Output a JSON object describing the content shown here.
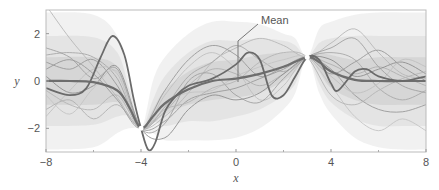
{
  "chart_data": {
    "type": "line",
    "title": "",
    "xlabel": "x",
    "ylabel": "y",
    "xlim": [
      -8,
      8
    ],
    "ylim": [
      -3,
      3
    ],
    "x_ticks": [
      -8,
      -4,
      0,
      4,
      8
    ],
    "x_tick_labels": [
      "−8",
      "−4",
      "0",
      "4",
      "8"
    ],
    "x_minor_ticks": [
      -6,
      -2,
      2,
      6
    ],
    "y_ticks": [
      2,
      0,
      -2
    ],
    "y_tick_labels": [
      "2",
      "0",
      "−2"
    ],
    "grid": false,
    "legend": null,
    "annotation": {
      "text": "Mean",
      "x": 0,
      "y": 0.1
    },
    "observations": {
      "x": [
        -4,
        3
      ],
      "y": [
        -2,
        1
      ]
    },
    "mean": {
      "name": "Mean",
      "x": [
        -8,
        -7,
        -6,
        -5,
        -4.5,
        -4,
        -3.5,
        -3,
        -2,
        -1,
        0,
        1,
        2,
        3,
        3.5,
        4,
        5,
        6,
        7,
        8
      ],
      "y": [
        0.0,
        0.0,
        -0.05,
        -0.4,
        -1.1,
        -2.0,
        -1.5,
        -0.95,
        -0.35,
        0.0,
        0.1,
        0.3,
        0.6,
        1.0,
        0.8,
        0.4,
        0.05,
        0.0,
        0.0,
        0.0
      ]
    },
    "bands": [
      {
        "name": "±3σ",
        "x": [
          -8,
          -6,
          -5,
          -4.5,
          -4,
          -3.5,
          -3,
          -2,
          -1,
          0,
          1,
          2,
          2.5,
          3,
          3.5,
          4,
          5,
          6,
          7,
          8
        ],
        "lower": [
          -2.9,
          -2.8,
          -2.2,
          -2.0,
          -2.0,
          -2.2,
          -2.5,
          -2.5,
          -2.5,
          -2.4,
          -2.0,
          -1.2,
          -0.5,
          1.0,
          -0.5,
          -1.4,
          -2.4,
          -2.8,
          -2.9,
          -2.9
        ],
        "upper": [
          2.9,
          2.8,
          1.9,
          0.0,
          -2.0,
          0.0,
          1.0,
          2.0,
          2.5,
          2.5,
          2.4,
          2.0,
          1.8,
          1.0,
          2.2,
          2.5,
          2.8,
          2.9,
          2.9,
          2.9
        ]
      },
      {
        "name": "±2σ",
        "x": [
          -8,
          -6,
          -5,
          -4.5,
          -4,
          -3.5,
          -3,
          -2,
          -1,
          0,
          1,
          2,
          2.5,
          3,
          3.5,
          4,
          5,
          6,
          7,
          8
        ],
        "lower": [
          -1.9,
          -1.85,
          -1.5,
          -1.5,
          -2.0,
          -1.7,
          -1.9,
          -1.7,
          -1.7,
          -1.5,
          -1.2,
          -0.6,
          -0.1,
          1.0,
          -0.1,
          -0.9,
          -1.6,
          -1.9,
          -1.9,
          -1.9
        ],
        "upper": [
          1.9,
          1.85,
          1.2,
          -0.3,
          -2.0,
          -0.8,
          0.2,
          1.2,
          1.7,
          1.7,
          1.8,
          1.7,
          1.5,
          1.0,
          1.6,
          1.8,
          1.9,
          1.9,
          1.9,
          1.9
        ]
      },
      {
        "name": "±1σ",
        "x": [
          -8,
          -6,
          -5,
          -4.5,
          -4,
          -3.5,
          -3,
          -2,
          -1,
          0,
          1,
          2,
          2.5,
          3,
          3.5,
          4,
          5,
          6,
          7,
          8
        ],
        "lower": [
          -1.0,
          -1.0,
          -0.9,
          -1.3,
          -2.0,
          -1.8,
          -1.4,
          -1.0,
          -0.8,
          -0.7,
          -0.5,
          0.0,
          0.4,
          1.0,
          0.4,
          -0.3,
          -0.8,
          -1.0,
          -1.0,
          -1.0
        ],
        "upper": [
          1.0,
          1.0,
          0.6,
          -0.7,
          -2.0,
          -1.2,
          -0.4,
          0.4,
          0.8,
          0.9,
          1.1,
          1.2,
          1.2,
          1.0,
          1.2,
          1.1,
          0.9,
          1.0,
          1.0,
          1.0
        ]
      }
    ],
    "highlighted_samples": [
      {
        "name": "sample-bold-1",
        "x": [
          -8,
          -7,
          -6.3,
          -5.7,
          -5.2,
          -4.7,
          -4.3,
          -4,
          -3.7,
          -3.4,
          -3,
          -2.5,
          -2,
          -1,
          0,
          0.5,
          1,
          1.5,
          2,
          2.5,
          3,
          3.5,
          4,
          4.3,
          5,
          5.5,
          6,
          7,
          8
        ],
        "y": [
          -0.3,
          -0.6,
          -0.3,
          1.0,
          1.9,
          1.1,
          -0.8,
          -2.0,
          -2.9,
          -2.6,
          -1.3,
          -0.6,
          -0.2,
          0.1,
          0.7,
          1.2,
          0.9,
          -0.6,
          -0.6,
          0.2,
          1.0,
          0.9,
          -0.1,
          -0.4,
          0.4,
          0.5,
          0.2,
          0.0,
          0.2
        ]
      }
    ],
    "samples": [
      {
        "x": [
          -8,
          -7,
          -6,
          -5,
          -4,
          -3,
          -2,
          -1,
          0,
          1,
          2,
          3,
          4,
          5,
          6,
          7,
          8
        ],
        "y": [
          3.2,
          1.8,
          0.6,
          -0.7,
          -2.0,
          -1.5,
          -0.5,
          0.8,
          1.4,
          1.8,
          1.5,
          1.0,
          1.6,
          2.2,
          1.2,
          0.3,
          0.1
        ]
      },
      {
        "x": [
          -8,
          -7,
          -6,
          -5,
          -4,
          -3,
          -2,
          -1,
          0,
          1,
          2,
          3,
          4,
          5,
          6,
          7,
          8
        ],
        "y": [
          1.1,
          1.2,
          1.0,
          0.1,
          -2.0,
          -1.1,
          0.2,
          0.8,
          1.5,
          0.9,
          0.4,
          1.0,
          1.2,
          0.9,
          -0.3,
          -0.8,
          -0.4
        ]
      },
      {
        "x": [
          -8,
          -7,
          -6,
          -5,
          -4,
          -3,
          -2,
          -1,
          0,
          1,
          2,
          3,
          4,
          5,
          6,
          7,
          8
        ],
        "y": [
          -0.6,
          -1.4,
          -0.3,
          0.4,
          -2.0,
          -0.9,
          -0.5,
          -0.4,
          0.2,
          0.6,
          0.9,
          1.0,
          -0.2,
          -1.5,
          -2.1,
          -1.6,
          -2.1
        ]
      },
      {
        "x": [
          -8,
          -7,
          -6,
          -5,
          -4,
          -3,
          -2,
          -1,
          0,
          1,
          2,
          3,
          4,
          5,
          6,
          7,
          8
        ],
        "y": [
          0.8,
          0.5,
          0.9,
          -0.2,
          -2.0,
          -1.7,
          -0.8,
          -0.5,
          -0.3,
          0.1,
          0.5,
          1.0,
          0.5,
          -0.6,
          -1.2,
          -1.3,
          -1.0
        ]
      },
      {
        "x": [
          -8,
          -7,
          -6,
          -5,
          -4,
          -3,
          -2,
          -1,
          0,
          1,
          2,
          3,
          4,
          5,
          6,
          7,
          8
        ],
        "y": [
          -1.2,
          -0.8,
          -1.6,
          -1.0,
          -2.0,
          -1.3,
          -0.2,
          0.5,
          0.3,
          -0.2,
          0.3,
          1.0,
          0.7,
          0.3,
          0.6,
          0.2,
          -0.2
        ]
      },
      {
        "x": [
          -8,
          -7,
          -6,
          -5,
          -4,
          -3,
          -2,
          -1,
          0,
          1,
          2,
          3,
          4,
          5,
          6,
          7,
          8
        ],
        "y": [
          0.2,
          -0.5,
          -0.2,
          0.6,
          -2.0,
          -2.4,
          -1.2,
          -0.6,
          -0.8,
          -0.5,
          0.3,
          1.0,
          0.9,
          0.2,
          0.5,
          0.8,
          0.3
        ]
      },
      {
        "x": [
          -8,
          -7,
          -6,
          -5,
          -4,
          -3,
          -2,
          -1,
          0,
          1,
          2,
          3,
          4,
          5,
          6,
          7,
          8
        ],
        "y": [
          -1.5,
          -0.4,
          0.5,
          0.3,
          -2.0,
          -0.6,
          0.6,
          1.2,
          0.5,
          -0.8,
          -0.2,
          1.0,
          0.2,
          -0.5,
          -0.1,
          0.9,
          0.6
        ]
      },
      {
        "x": [
          -8,
          -7,
          -6,
          -5,
          -4,
          -3,
          -2,
          -1,
          0,
          1,
          2,
          3,
          4,
          5,
          6,
          7,
          8
        ],
        "y": [
          1.4,
          1.0,
          0.1,
          0.5,
          -2.0,
          -1.8,
          0.0,
          0.3,
          -0.6,
          -0.9,
          0.1,
          1.0,
          1.4,
          1.8,
          0.6,
          -0.2,
          -0.5
        ]
      },
      {
        "x": [
          -8,
          -7,
          -6,
          -5,
          -4,
          -3,
          -2,
          -1,
          0,
          1,
          2,
          3,
          4,
          5,
          6,
          7,
          8
        ],
        "y": [
          -0.4,
          -1.0,
          -1.2,
          -0.6,
          -2.0,
          -1.2,
          -0.9,
          -0.3,
          0.0,
          0.8,
          1.2,
          1.0,
          -0.6,
          -1.0,
          -0.4,
          0.1,
          0.4
        ]
      },
      {
        "x": [
          -8,
          -7,
          -6,
          -5,
          -4,
          -3,
          -2,
          -1,
          0,
          1,
          2,
          3,
          4,
          5,
          6,
          7,
          8
        ],
        "y": [
          0.5,
          0.9,
          0.3,
          -0.8,
          -2.0,
          -0.4,
          0.9,
          1.5,
          1.1,
          0.2,
          0.6,
          1.0,
          0.3,
          0.8,
          1.3,
          0.6,
          0.0
        ]
      }
    ]
  },
  "figure": {
    "annotation_label": "Mean",
    "xlabel": "x",
    "ylabel": "y"
  }
}
